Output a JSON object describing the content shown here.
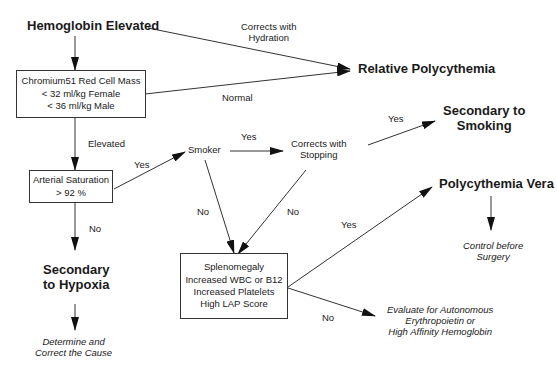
{
  "nodes": {
    "hemoglobin_elevated": "Hemoglobin Elevated",
    "red_cell_mass": "Chromium51 Red Cell Mass\n< 32 ml/kg Female\n< 36 ml/kg Male",
    "relative_polycythemia": "Relative Polycythemia",
    "arterial_saturation": "Arterial Saturation\n> 92 %",
    "smoker": "Smoker",
    "corrects_with_stopping": "Corrects with\nStopping",
    "secondary_to_smoking": "Secondary to\nSmoking",
    "secondary_to_hypoxia": "Secondary\nto Hypoxia",
    "determine_cause": "Determine and\nCorrect the Cause",
    "splenomegaly": "Splenomegaly\nIncreased WBC or B12\nIncreased Platelets\nHigh LAP Score",
    "polycythemia_vera": "Polycythemia Vera",
    "control_before_surgery": "Control before\nSurgery",
    "evaluate_autonomous": "Evaluate for Autonomous\nErythropoietin or\nHigh Affinity Hemoglobin"
  },
  "edge_labels": {
    "corrects_with_hydration": "Corrects with\nHydration",
    "normal": "Normal",
    "elevated": "Elevated",
    "yes_smoker": "Yes",
    "yes_stopping": "Yes",
    "yes_smoking": "Yes",
    "no_hypoxia": "No",
    "no_smoker": "No",
    "no_stopping": "No",
    "yes_vera": "Yes",
    "no_evaluate": "No"
  }
}
